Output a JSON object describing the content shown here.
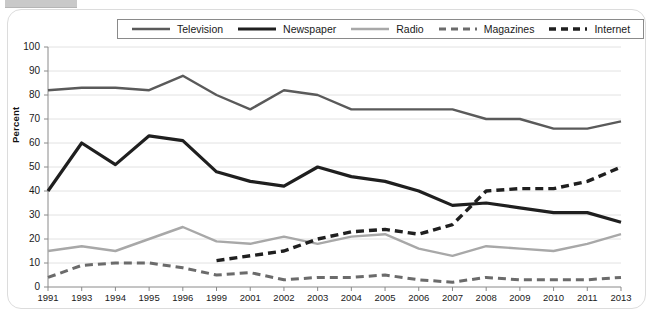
{
  "frame": {
    "border_color": "#dcdcdc",
    "background": "#ffffff"
  },
  "legend": {
    "position": "top-center",
    "items": [
      {
        "label": "Television",
        "color": "#5a5a5a",
        "style": "solid",
        "width": 2.4
      },
      {
        "label": "Newspaper",
        "color": "#1f1f1f",
        "style": "solid",
        "width": 3.2
      },
      {
        "label": "Radio",
        "color": "#a8a8a8",
        "style": "solid",
        "width": 2.4
      },
      {
        "label": "Magazines",
        "color": "#6b6b6b",
        "style": "dashed",
        "width": 3.0
      },
      {
        "label": "Internet",
        "color": "#1f1f1f",
        "style": "dashed",
        "width": 3.4
      }
    ]
  },
  "chart_data": {
    "type": "line",
    "title": "",
    "xlabel": "",
    "ylabel": "Percent",
    "ylim": [
      0,
      100
    ],
    "ytick_step": 10,
    "yticks": [
      0,
      10,
      20,
      30,
      40,
      50,
      60,
      70,
      80,
      90,
      100
    ],
    "grid": true,
    "categories": [
      "1991",
      "1993",
      "1994",
      "1995",
      "1996",
      "1999",
      "2001",
      "2002",
      "2003",
      "2004",
      "2005",
      "2006",
      "2007",
      "2008",
      "2009",
      "2010",
      "2011",
      "2013"
    ],
    "series": [
      {
        "name": "Television",
        "color": "#5a5a5a",
        "style": "solid",
        "width": 2.4,
        "values": [
          82,
          83,
          83,
          82,
          88,
          80,
          74,
          82,
          80,
          74,
          74,
          74,
          74,
          70,
          70,
          66,
          66,
          69
        ]
      },
      {
        "name": "Newspaper",
        "color": "#1f1f1f",
        "style": "solid",
        "width": 3.2,
        "values": [
          40,
          60,
          51,
          63,
          61,
          48,
          44,
          42,
          50,
          46,
          44,
          40,
          34,
          35,
          33,
          31,
          31,
          27
        ]
      },
      {
        "name": "Radio",
        "color": "#a8a8a8",
        "style": "solid",
        "width": 2.4,
        "values": [
          15,
          17,
          15,
          20,
          25,
          19,
          18,
          21,
          18,
          21,
          22,
          16,
          13,
          17,
          16,
          15,
          18,
          22
        ]
      },
      {
        "name": "Magazines",
        "color": "#6b6b6b",
        "style": "dashed",
        "width": 3.0,
        "values": [
          4,
          9,
          10,
          10,
          8,
          5,
          6,
          3,
          4,
          4,
          5,
          3,
          2,
          4,
          3,
          3,
          3,
          4
        ]
      },
      {
        "name": "Internet",
        "color": "#1f1f1f",
        "style": "dashed",
        "width": 3.4,
        "values": [
          null,
          null,
          null,
          null,
          null,
          11,
          13,
          15,
          20,
          23,
          24,
          22,
          26,
          40,
          41,
          41,
          44,
          50
        ]
      }
    ]
  }
}
